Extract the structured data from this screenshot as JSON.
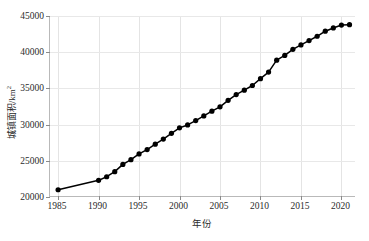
{
  "chart_data": {
    "type": "line",
    "title": "",
    "xlabel": "年份",
    "ylabel": "城镇面积/km²",
    "ylabel_text": "城镇面积/km",
    "ylabel_exponent": "2",
    "xlim": [
      1984,
      2021.8
    ],
    "ylim": [
      20000,
      45000
    ],
    "grid": true,
    "legend": null,
    "marker": "filled-circle",
    "line_color": "#000000",
    "marker_color": "#000000",
    "xticks": [
      1985,
      1990,
      1995,
      2000,
      2005,
      2010,
      2015,
      2020
    ],
    "xticklabels": [
      "1985",
      "1990",
      "1995",
      "2000",
      "2005",
      "2010",
      "2015",
      "2020"
    ],
    "yticks": [
      20000,
      25000,
      30000,
      35000,
      40000,
      45000
    ],
    "yticklabels": [
      "20000",
      "25000",
      "30000",
      "35000",
      "40000",
      "45000"
    ],
    "x": [
      1985,
      1990,
      1991,
      1992,
      1993,
      1994,
      1995,
      1996,
      1997,
      1998,
      1999,
      2000,
      2001,
      2002,
      2003,
      2004,
      2005,
      2006,
      2007,
      2008,
      2009,
      2010,
      2011,
      2012,
      2013,
      2014,
      2015,
      2016,
      2017,
      2018,
      2019,
      2020,
      2021
    ],
    "values": [
      21000,
      22300,
      22800,
      23500,
      24500,
      25150,
      25950,
      26550,
      27300,
      28000,
      28800,
      29550,
      29950,
      30550,
      31200,
      31850,
      32450,
      33350,
      34150,
      34750,
      35400,
      36350,
      37250,
      38900,
      39550,
      40400,
      41000,
      41600,
      42200,
      42900,
      43350,
      43750,
      43800
    ],
    "series": [
      {
        "name": "城镇面积",
        "x": [
          1985,
          1990,
          1991,
          1992,
          1993,
          1994,
          1995,
          1996,
          1997,
          1998,
          1999,
          2000,
          2001,
          2002,
          2003,
          2004,
          2005,
          2006,
          2007,
          2008,
          2009,
          2010,
          2011,
          2012,
          2013,
          2014,
          2015,
          2016,
          2017,
          2018,
          2019,
          2020,
          2021
        ],
        "values": [
          21000,
          22300,
          22800,
          23500,
          24500,
          25150,
          25950,
          26550,
          27300,
          28000,
          28800,
          29550,
          29950,
          30550,
          31200,
          31850,
          32450,
          33350,
          34150,
          34750,
          35400,
          36350,
          37250,
          38900,
          39550,
          40400,
          41000,
          41600,
          42200,
          42900,
          43350,
          43750,
          43800
        ]
      }
    ]
  }
}
